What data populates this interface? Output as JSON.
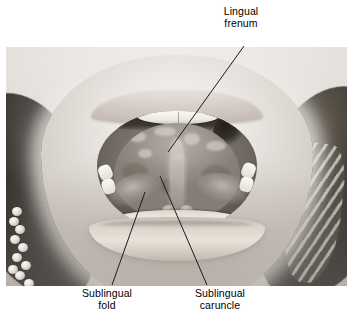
{
  "figure": {
    "type": "anatomical-photograph",
    "background_color": "#ffffff",
    "text_color": "#000000",
    "photo": {
      "style": "grayscale",
      "x": 6,
      "y": 47,
      "width": 341,
      "height": 239
    }
  },
  "labels": [
    {
      "id": "lingual-frenum",
      "text": "Lingual\nfrenum",
      "line1": "Lingual",
      "line2": "frenum",
      "position": "top-right",
      "leader": {
        "x1": 244,
        "y1": 46,
        "x2": 168,
        "y2": 152
      }
    },
    {
      "id": "sublingual-fold",
      "text": "Sublingual\nfold",
      "line1": "Sublingual",
      "line2": "fold",
      "position": "bottom-left",
      "leader": {
        "x1": 145,
        "y1": 192,
        "x2": 112,
        "y2": 285
      }
    },
    {
      "id": "sublingual-caruncle",
      "text": "Sublingual\ncaruncle",
      "line1": "Sublingual",
      "line2": "caruncle",
      "position": "bottom-right",
      "leader": {
        "x1": 160,
        "y1": 176,
        "x2": 207,
        "y2": 285
      }
    }
  ],
  "leader_line": {
    "color": "#1a1a1a",
    "width": 1
  }
}
